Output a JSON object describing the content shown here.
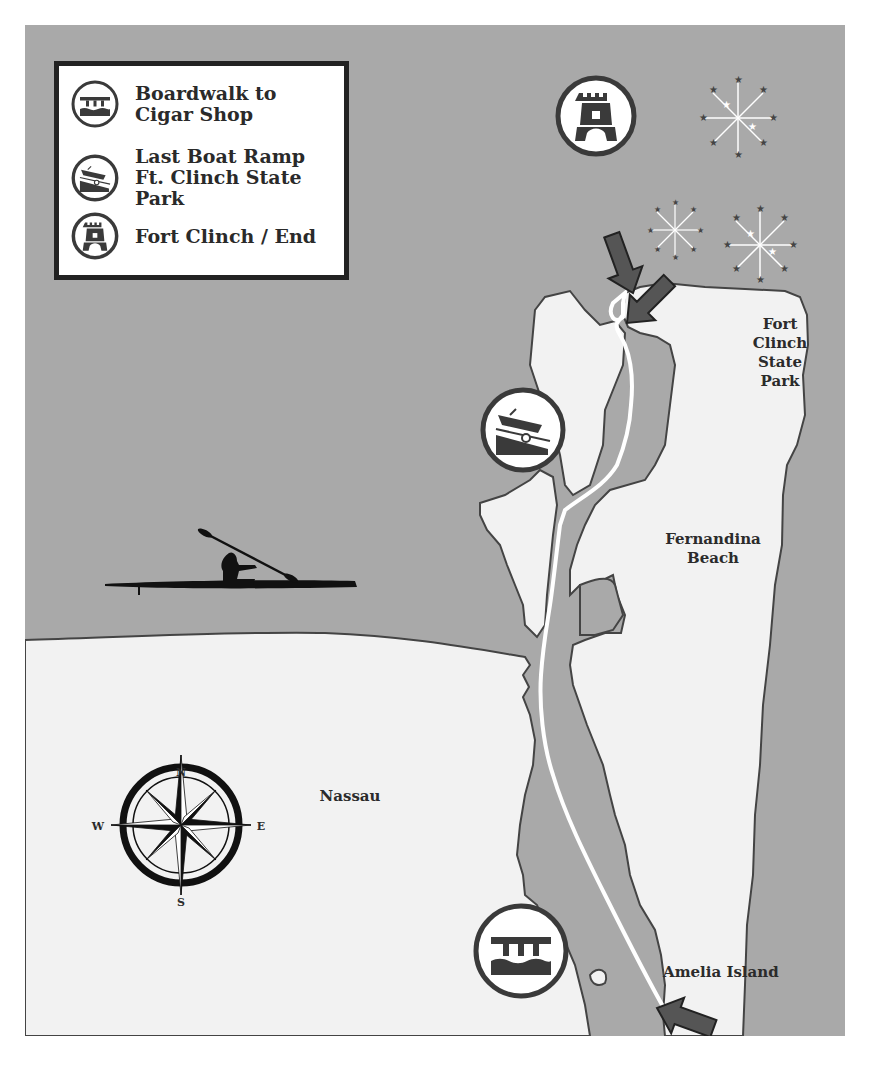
{
  "legend": {
    "items": [
      {
        "icon": "boardwalk-icon",
        "label": "Boardwalk to Cigar Shop"
      },
      {
        "icon": "boat-ramp-icon",
        "label": "Last Boat Ramp Ft. Clinch State Park"
      },
      {
        "icon": "fort-tower-icon",
        "label": "Fort Clinch / End"
      }
    ]
  },
  "places": {
    "fort_clinch": "Fort Clinch State Park",
    "fort_clinch_lines": [
      "Fort",
      "Clinch",
      "State",
      "Park"
    ],
    "fernandina_lines": [
      "Fernandina",
      "Beach"
    ],
    "nassau": "Nassau",
    "amelia": "Amelia Island"
  },
  "compass": {
    "n": "N",
    "s": "S",
    "e": "E",
    "w": "W"
  },
  "markers": [
    {
      "id": "fort",
      "icon": "fort-tower-icon",
      "label": "Fort Clinch / End"
    },
    {
      "id": "ramp",
      "icon": "boat-ramp-icon",
      "label": "Last Boat Ramp Ft. Clinch State Park"
    },
    {
      "id": "boardwalk",
      "icon": "boardwalk-icon",
      "label": "Boardwalk to Cigar Shop"
    }
  ],
  "colors": {
    "water": "#a9a9a9",
    "land": "#f2f2f2",
    "outline": "#444444",
    "route": "#ffffff",
    "arrow": "#555555",
    "icon_dark": "#3a3a3a"
  }
}
